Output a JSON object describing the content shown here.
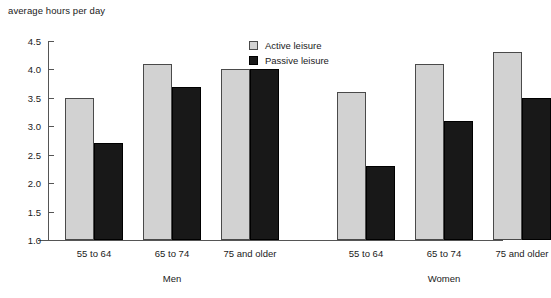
{
  "chart_data": {
    "type": "bar",
    "title": "average hours per day",
    "xlabel": "",
    "ylabel": "average hours per day",
    "ylim": [
      1.0,
      4.5
    ],
    "ytick_labels": [
      "4.5",
      "4.0",
      "3.5",
      "3.0",
      "2.5",
      "2.0",
      "1.5",
      "1.0"
    ],
    "ytick_values": [
      4.5,
      4.0,
      3.5,
      3.0,
      2.5,
      2.0,
      1.5,
      1.0
    ],
    "grid": false,
    "legend_position": "top-center",
    "categories": [
      "55 to 64",
      "65 to 74",
      "75 and older",
      "55 to 64",
      "65 to 74",
      "75 and older"
    ],
    "groups": [
      {
        "name": "Men",
        "categories": [
          "55 to 64",
          "65 to 74",
          "75 and older"
        ]
      },
      {
        "name": "Women",
        "categories": [
          "55 to 64",
          "65 to 74",
          "75 and older"
        ]
      }
    ],
    "series": [
      {
        "name": "Active leisure",
        "color": "#d2d2d2",
        "values": [
          3.5,
          4.1,
          4.0,
          3.6,
          4.1,
          4.3
        ]
      },
      {
        "name": "Passive leisure",
        "color": "#181818",
        "values": [
          2.7,
          3.7,
          4.0,
          2.3,
          3.1,
          3.5
        ]
      }
    ]
  },
  "legend": {
    "items": [
      {
        "label": "Active leisure"
      },
      {
        "label": "Passive leisure"
      }
    ]
  },
  "axis": {
    "y_labels": [
      "4.5",
      "4.0",
      "3.5",
      "3.0",
      "2.5",
      "2.0",
      "1.5",
      "1.0"
    ]
  },
  "categories": {
    "men_1": "55 to 64",
    "men_2": "65 to 74",
    "men_3": "75 and older",
    "women_1": "55 to 64",
    "women_2": "65 to 74",
    "women_3": "75 and older"
  },
  "groups": {
    "men": "Men",
    "women": "Women"
  }
}
